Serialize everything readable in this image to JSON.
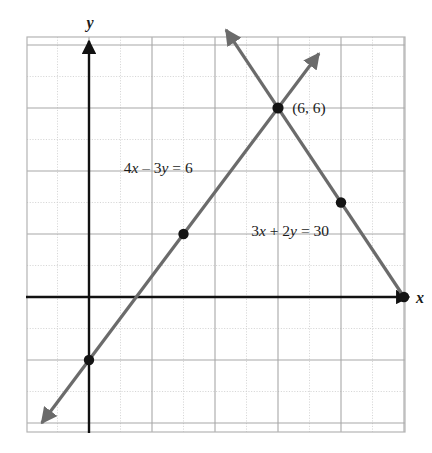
{
  "figure": {
    "name": "system-of-linear-equations-graph",
    "axis_labels": {
      "x": "x",
      "y": "y"
    },
    "colors": {
      "line": "#6b6b6b",
      "axis": "#111111",
      "grid_major": "#a8a8a8",
      "grid_minor": "#cfcfcf",
      "frame": "#b4b4b4",
      "text": "#1b1b1b",
      "background": "#ffffff"
    }
  },
  "chart_data": {
    "type": "line",
    "title": "",
    "xlabel": "x",
    "ylabel": "y",
    "xlim": [
      -2,
      10.1
    ],
    "ylim": [
      -4.25,
      8.25
    ],
    "grid": true,
    "grid_major_step": 2,
    "grid_minor_step": 1,
    "legend": "none",
    "series": [
      {
        "name": "4x - 3y = 6",
        "label": "4x – 3y = 6",
        "label_x": 1.1,
        "label_y": 3.95,
        "equation": {
          "a": 4,
          "b": -3,
          "c": 6
        },
        "slope": 1.3333,
        "y_intercept": -2,
        "x_from": -1.5,
        "y_from": -4.0,
        "x_to": 7.3,
        "y_to": 7.73,
        "arrow_start": true,
        "arrow_end": true,
        "points": [
          {
            "x": 0,
            "y": -2,
            "labeled": false
          },
          {
            "x": 3,
            "y": 2,
            "labeled": false
          }
        ]
      },
      {
        "name": "3x + 2y = 30",
        "label": "3x + 2y = 30",
        "label_x": 5.15,
        "label_y": 1.95,
        "equation": {
          "a": 3,
          "b": 2,
          "c": 30
        },
        "slope": -1.5,
        "y_intercept": 15,
        "x_from": 4.35,
        "y_from": 8.48,
        "x_to": 10,
        "y_to": 0,
        "arrow_start": true,
        "arrow_end": false,
        "points": [
          {
            "x": 8,
            "y": 3,
            "labeled": false
          },
          {
            "x": 10,
            "y": 0,
            "labeled": false
          }
        ]
      }
    ],
    "intersection": {
      "x": 6,
      "y": 6,
      "label": "(6, 6)",
      "label_x": 6.45,
      "label_y": 5.85
    }
  }
}
